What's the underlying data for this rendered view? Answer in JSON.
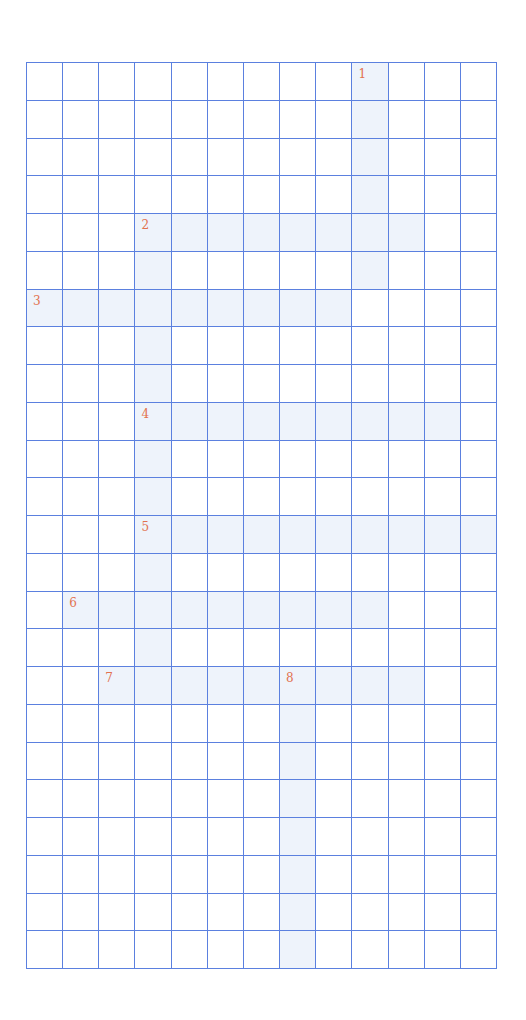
{
  "puzzle": {
    "type": "crossword",
    "cols": 13,
    "rows": 24,
    "colors": {
      "grid_line": "#5b80df",
      "active_cell": "#eef3fb",
      "empty_cell": "#ffffff",
      "clue_number": "#e2724f"
    },
    "entries": [
      {
        "number": "1",
        "direction": "down",
        "row": 0,
        "col": 9,
        "length": 6
      },
      {
        "number": "2",
        "direction": "across",
        "row": 4,
        "col": 3,
        "length": 8
      },
      {
        "number": "2",
        "direction": "down",
        "row": 4,
        "col": 3,
        "length": 13
      },
      {
        "number": "3",
        "direction": "across",
        "row": 6,
        "col": 0,
        "length": 9
      },
      {
        "number": "4",
        "direction": "across",
        "row": 9,
        "col": 3,
        "length": 9
      },
      {
        "number": "5",
        "direction": "across",
        "row": 12,
        "col": 3,
        "length": 10
      },
      {
        "number": "6",
        "direction": "across",
        "row": 14,
        "col": 1,
        "length": 9
      },
      {
        "number": "7",
        "direction": "across",
        "row": 16,
        "col": 2,
        "length": 9
      },
      {
        "number": "8",
        "direction": "down",
        "row": 16,
        "col": 7,
        "length": 8
      }
    ]
  }
}
